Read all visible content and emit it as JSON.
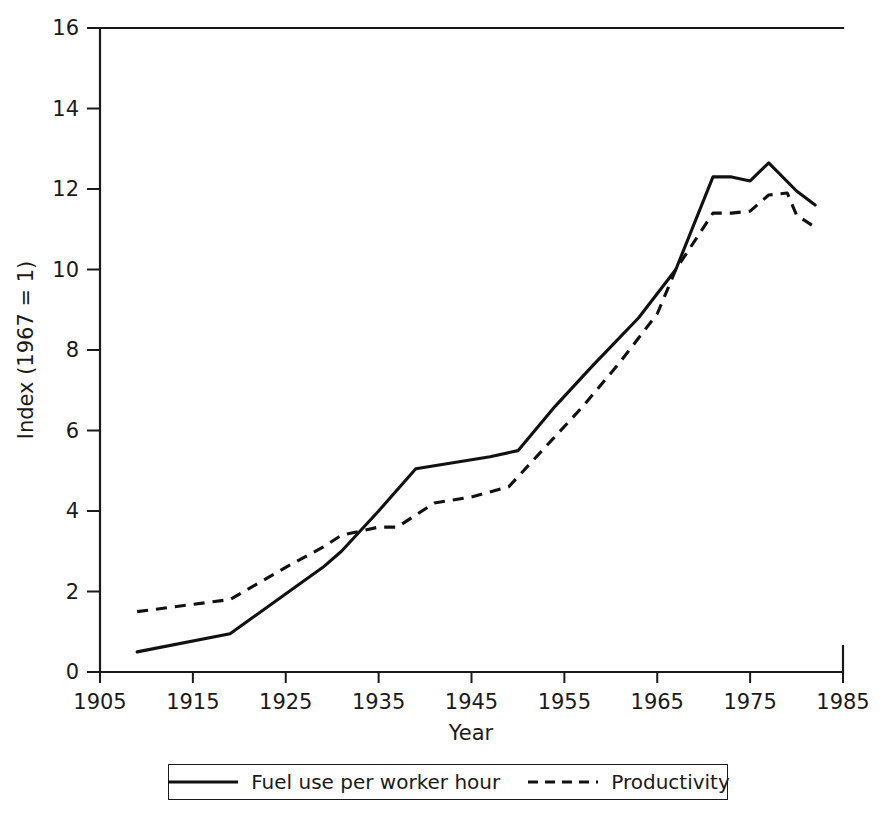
{
  "chart_data": {
    "type": "line",
    "title": "",
    "xlabel": "Year",
    "ylabel": "Index (1967 = 1)",
    "xlim": [
      1905,
      1985
    ],
    "ylim": [
      0,
      16
    ],
    "xticks": [
      1905,
      1915,
      1925,
      1935,
      1945,
      1955,
      1965,
      1975,
      1985
    ],
    "yticks": [
      0,
      2,
      4,
      6,
      8,
      10,
      12,
      14,
      16
    ],
    "grid": false,
    "legend_position": "bottom",
    "series": [
      {
        "name": "Fuel use per worker hour",
        "style": "solid",
        "x": [
          1909,
          1919,
          1929,
          1931,
          1935,
          1939,
          1947,
          1950,
          1954,
          1958,
          1963,
          1967,
          1971,
          1973,
          1975,
          1977,
          1980,
          1982
        ],
        "values": [
          0.5,
          0.95,
          2.6,
          3.0,
          4.0,
          5.05,
          5.35,
          5.5,
          6.6,
          7.6,
          8.8,
          10.0,
          12.3,
          12.3,
          12.2,
          12.65,
          11.95,
          11.6
        ]
      },
      {
        "name": "Productivity",
        "style": "dashed",
        "x": [
          1909,
          1919,
          1925,
          1929,
          1931,
          1935,
          1937,
          1941,
          1945,
          1949,
          1953,
          1957,
          1961,
          1965,
          1967,
          1971,
          1973,
          1975,
          1977,
          1979,
          1980,
          1982
        ],
        "values": [
          1.5,
          1.8,
          2.6,
          3.1,
          3.4,
          3.6,
          3.6,
          4.2,
          4.35,
          4.6,
          5.6,
          6.6,
          7.7,
          8.9,
          10.0,
          11.4,
          11.4,
          11.45,
          11.85,
          11.9,
          11.35,
          11.05
        ]
      }
    ]
  },
  "legend": {
    "entries": [
      {
        "label": "Fuel use per worker hour",
        "style": "solid"
      },
      {
        "label": "Productivity",
        "style": "dashed"
      }
    ]
  },
  "colors": {
    "line": "#111111",
    "axis": "#1a1a1a",
    "background": "#ffffff"
  }
}
